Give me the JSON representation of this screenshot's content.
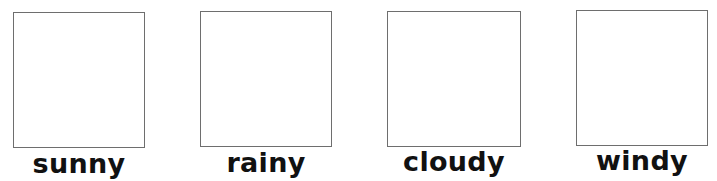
{
  "cards": [
    {
      "label": "sunny"
    },
    {
      "label": "rainy"
    },
    {
      "label": "cloudy"
    },
    {
      "label": "windy"
    }
  ],
  "colors": {
    "box_border": "#6e6e6e",
    "label_text": "#111111",
    "background": "#ffffff"
  }
}
